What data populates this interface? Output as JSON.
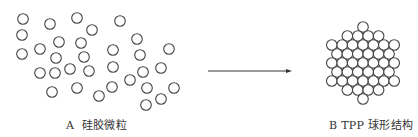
{
  "figure": {
    "panel_a": {
      "label": "A  硅胶微粒",
      "description": "scattered silica gel particles",
      "circle_radius": 5.3,
      "circles": [
        [
          23,
          19
        ],
        [
          50,
          24
        ],
        [
          77,
          18
        ],
        [
          120,
          21
        ],
        [
          92,
          30
        ],
        [
          22,
          35
        ],
        [
          59,
          42
        ],
        [
          81,
          43
        ],
        [
          137,
          39
        ],
        [
          22,
          54
        ],
        [
          40,
          49
        ],
        [
          56,
          58
        ],
        [
          84,
          57
        ],
        [
          113,
          50
        ],
        [
          140,
          55
        ],
        [
          169,
          49
        ],
        [
          40,
          73
        ],
        [
          55,
          73
        ],
        [
          70,
          69
        ],
        [
          89,
          71
        ],
        [
          113,
          67
        ],
        [
          143,
          72
        ],
        [
          161,
          68
        ],
        [
          130,
          80
        ],
        [
          52,
          92
        ],
        [
          77,
          88
        ],
        [
          99,
          96
        ],
        [
          112,
          87
        ],
        [
          147,
          88
        ],
        [
          174,
          88
        ],
        [
          146,
          105
        ],
        [
          161,
          99
        ]
      ]
    },
    "arrow": {
      "x1": 208,
      "y1": 71,
      "x2": 292,
      "y2": 71,
      "color": "#333333"
    },
    "panel_b": {
      "label": "B TPP 球形结构",
      "description": "packed spherical TPP structure",
      "center": [
        363,
        63
      ],
      "outer_radius": 40,
      "circle_radius": 5.3
    },
    "stroke_color": "#444444"
  }
}
